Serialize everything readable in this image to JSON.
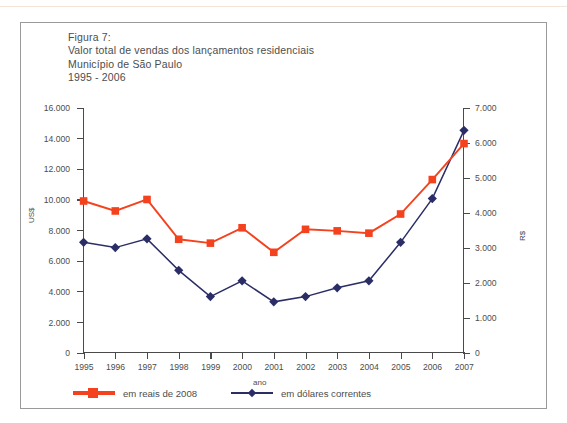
{
  "figure": {
    "title_lines": [
      "Figura 7:",
      "Valor total de vendas dos lançamentos residenciais",
      "Município de São Paulo",
      "1995 - 2006"
    ]
  },
  "axes": {
    "left_title": "US$",
    "right_title": "R$",
    "x_title": "ano",
    "left_ticks": [
      "0",
      "2.000",
      "4.000",
      "6.000",
      "8.000",
      "10.000",
      "12.000",
      "14.000",
      "16.000"
    ],
    "right_ticks": [
      "0",
      "1.000",
      "2.000",
      "3.000",
      "4.000",
      "5.000",
      "6.000",
      "7.000"
    ],
    "x_ticks": [
      "1995",
      "1996",
      "1997",
      "1998",
      "1999",
      "2000",
      "2001",
      "2002",
      "2003",
      "2004",
      "2005",
      "2006",
      "2007"
    ]
  },
  "legend": {
    "items": [
      {
        "label": "em reais de 2008",
        "color": "#F4421E",
        "marker": "square"
      },
      {
        "label": "em dólares correntes",
        "color": "#2B2E66",
        "marker": "diamond"
      }
    ]
  },
  "colors": {
    "reais": "#F4421E",
    "dolares": "#2B2E66",
    "axis": "#4A4A4A",
    "text": "#4D4D4D",
    "frame": "#9A9A9A"
  },
  "chart_data": {
    "type": "line",
    "xlabel": "ano",
    "ylabel": "US$",
    "y2label": "R$",
    "x": [
      1995,
      1996,
      1997,
      1998,
      1999,
      2000,
      2001,
      2002,
      2003,
      2004,
      2005,
      2006,
      2007
    ],
    "ylim": [
      0,
      16000
    ],
    "y2lim": [
      0,
      7000
    ],
    "grid": false,
    "legend_position": "bottom-left",
    "series": [
      {
        "name": "em reais de 2008",
        "axis": "left",
        "color": "#F4421E",
        "marker": "square",
        "values": [
          9900,
          9250,
          10000,
          7400,
          7150,
          8150,
          6550,
          8050,
          7950,
          7800,
          9050,
          11300,
          13650
        ]
      },
      {
        "name": "em dólares correntes",
        "axis": "right",
        "color": "#2B2E66",
        "marker": "diamond",
        "values_right_axis": [
          3150,
          3000,
          3250,
          2350,
          1600,
          2050,
          1450,
          1600,
          1850,
          2050,
          3150,
          4400,
          6350
        ],
        "values": [
          7200,
          6850,
          7430,
          5370,
          3660,
          4690,
          3310,
          3660,
          4230,
          4690,
          7200,
          10000,
          14520
        ]
      }
    ]
  }
}
